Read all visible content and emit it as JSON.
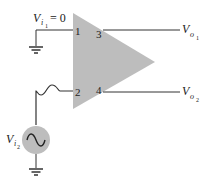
{
  "diagram": {
    "type": "differential-amplifier",
    "amplifier": {
      "fill": "#bdbdbd",
      "shape": "triangle"
    },
    "pins": {
      "in1": "1",
      "in2": "2",
      "out1": "3",
      "out2": "4"
    },
    "inputs": {
      "vi1": {
        "symbol": "V",
        "subscript": "i",
        "subsub": "1",
        "value_text": "= 0"
      },
      "vi2": {
        "symbol": "V",
        "subscript": "i",
        "subsub": "2"
      }
    },
    "outputs": {
      "vo1": {
        "symbol": "V",
        "subscript": "o",
        "subsub": "1"
      },
      "vo2": {
        "symbol": "V",
        "subscript": "o",
        "subsub": "2"
      }
    },
    "source_fill": "#bdbdbd",
    "wire_color": "#333333"
  }
}
